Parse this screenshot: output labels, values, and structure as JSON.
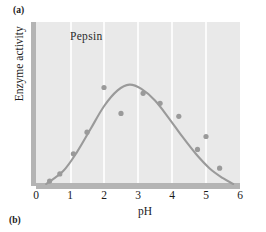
{
  "figure": {
    "panel_a_label": "(a)",
    "panel_b_label": "(b)"
  },
  "colors": {
    "plot_background": "#e9e9e9",
    "gridline": "#fbfbfb",
    "axis_bar": "#b4b4b4",
    "curve": "#9a9a9a",
    "marker": "#9a9a9a",
    "text": "#1a1a1a",
    "page_background": "#ffffff"
  },
  "chart_data": {
    "type": "scatter",
    "title": "",
    "series_label": "Pepsin",
    "xlabel": "pH",
    "ylabel": "Enzyme activity",
    "xlim": [
      0,
      6
    ],
    "ylim": [
      0,
      100
    ],
    "xticks": [
      0,
      1,
      2,
      3,
      4,
      5,
      6
    ],
    "xtick_labels": [
      "0",
      "1",
      "2",
      "3",
      "4",
      "5",
      "6"
    ],
    "yticks": [],
    "ytick_labels": [],
    "grid": "vertical gridlines at each integer pH",
    "legend": "none (inline series label)",
    "points": [
      {
        "x": 0.4,
        "y": 2
      },
      {
        "x": 0.7,
        "y": 7
      },
      {
        "x": 1.1,
        "y": 21
      },
      {
        "x": 1.5,
        "y": 36
      },
      {
        "x": 2.0,
        "y": 67
      },
      {
        "x": 2.5,
        "y": 49
      },
      {
        "x": 3.15,
        "y": 63
      },
      {
        "x": 3.65,
        "y": 56
      },
      {
        "x": 4.2,
        "y": 47
      },
      {
        "x": 4.75,
        "y": 24
      },
      {
        "x": 5.0,
        "y": 33
      },
      {
        "x": 5.4,
        "y": 11
      }
    ],
    "fitted_curve": {
      "description": "bell-shaped optimum curve",
      "x": [
        0.3,
        0.8,
        1.2,
        1.6,
        2.0,
        2.4,
        2.75,
        3.1,
        3.5,
        3.9,
        4.3,
        4.7,
        5.1,
        5.5,
        5.8
      ],
      "y": [
        0,
        9,
        22,
        38,
        54,
        65,
        69,
        66,
        58,
        46,
        33,
        21,
        11,
        4,
        0
      ],
      "optimum_ph": 2.75
    }
  }
}
